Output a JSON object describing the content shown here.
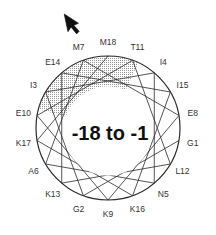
{
  "diagram": {
    "type": "helical-wheel",
    "center_label": "-18 to -1",
    "center": [
      108,
      128
    ],
    "radius": 72,
    "label_radius": 86,
    "degrees_per_residue": 100,
    "arrow_icon": "cursor-arrow-icon",
    "residues": [
      {
        "label": "G1",
        "n": 1
      },
      {
        "label": "G2",
        "n": 2
      },
      {
        "label": "I3",
        "n": 3
      },
      {
        "label": "I4",
        "n": 4
      },
      {
        "label": "N5",
        "n": 5
      },
      {
        "label": "A6",
        "n": 6
      },
      {
        "label": "M7",
        "n": 7
      },
      {
        "label": "E8",
        "n": 8
      },
      {
        "label": "K9",
        "n": 9
      },
      {
        "label": "E10",
        "n": 10
      },
      {
        "label": "T11",
        "n": 11
      },
      {
        "label": "L12",
        "n": 12
      },
      {
        "label": "K13",
        "n": 13
      },
      {
        "label": "E14",
        "n": 14
      },
      {
        "label": "I15",
        "n": 15
      },
      {
        "label": "K16",
        "n": 16
      },
      {
        "label": "K17",
        "n": 17
      },
      {
        "label": "M18",
        "n": 18
      }
    ],
    "angle_of_M18_deg": 0,
    "shaded_sector": {
      "from_deg": -75,
      "to_deg": 25,
      "fill": "#bdbdbd"
    },
    "colors": {
      "line": "#2a2a2a",
      "shade": "#c4c4c4",
      "text": "#333333"
    }
  }
}
